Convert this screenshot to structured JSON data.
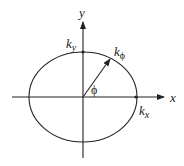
{
  "diagram": {
    "type": "ellipse-coordinate-diagram",
    "axes": {
      "x_label": "x",
      "y_label": "y"
    },
    "labels": {
      "ky_main": "k",
      "ky_sub": "y",
      "kx_main": "k",
      "kx_sub": "x",
      "kphi_main": "k",
      "kphi_sub": "ϕ",
      "phi": "ϕ"
    },
    "geometry": {
      "center": [
        83,
        97
      ],
      "rx": 54,
      "ry": 45,
      "vector_end": [
        110,
        59
      ]
    },
    "colors": {
      "stroke": "#222222",
      "background": "#ffffff"
    }
  }
}
